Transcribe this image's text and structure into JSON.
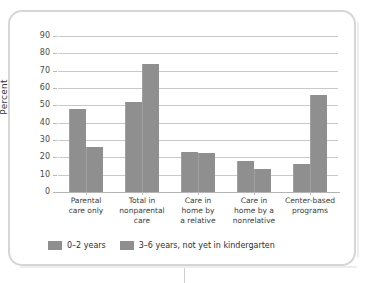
{
  "chart_data": {
    "type": "bar",
    "title": "",
    "subtitle": "",
    "xlabel": "",
    "ylabel": "Percent",
    "ylim": [
      0,
      90
    ],
    "ytick_values": [
      0,
      10,
      20,
      30,
      40,
      50,
      60,
      70,
      80,
      90
    ],
    "ytick_labels": [
      "0",
      "10",
      "20",
      "30",
      "40",
      "50",
      "60",
      "70",
      "80",
      "90"
    ],
    "grid": true,
    "grid_axis": "y",
    "legend_position": "bottom-left",
    "categories": [
      "Parental\ncare only",
      "Total in\nnonparental\ncare",
      "Care in\nhome by\na relative",
      "Care in\nhome by a\nnonrelative",
      "Center-based\nprograms"
    ],
    "series": [
      {
        "name": "0–2 years",
        "color": "#8f8f8f",
        "values": [
          48,
          52,
          23,
          17.8,
          16
        ]
      },
      {
        "name": "3–6 years, not yet in kindergarten",
        "color": "#8f8f8f",
        "values": [
          26,
          74,
          22.5,
          13.5,
          56
        ]
      }
    ]
  },
  "axis": {
    "y_title": "Percent"
  },
  "legend": {
    "entries": [
      {
        "label": "0–2 years",
        "color": "#8f8f8f"
      },
      {
        "label": "3–6 years, not yet in kindergarten",
        "color": "#8f8f8f"
      }
    ]
  },
  "colors": {
    "bar": "#8f8f8f",
    "gridline": "#c9c9c9",
    "frame_border": "#d6d6d6",
    "tick_text": "#4a4a4a",
    "label_text": "#3b3b3b"
  }
}
